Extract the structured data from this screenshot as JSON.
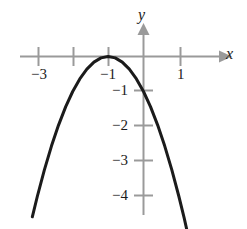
{
  "chart_data": {
    "type": "line",
    "title": "",
    "xlabel": "x",
    "ylabel": "y",
    "equation": "y = -(x + 1)^2",
    "vertex": [
      -1,
      0
    ],
    "opens": "down",
    "xlim": [
      -3.4,
      1.6
    ],
    "ylim": [
      -4.7,
      0.8
    ],
    "grid": false,
    "legend": null,
    "x_ticks": [
      -3,
      -2,
      -1,
      1
    ],
    "x_tick_labels": [
      "-3",
      "",
      "-1",
      "1"
    ],
    "y_ticks": [
      -1,
      -2,
      -3,
      -4
    ],
    "y_tick_labels": [
      "-1",
      "-2",
      "-3",
      "-4"
    ],
    "x": [
      -3.14,
      -3.0,
      -2.8,
      -2.6,
      -2.4,
      -2.2,
      -2.0,
      -1.8,
      -1.6,
      -1.4,
      -1.2,
      -1.0,
      -0.8,
      -0.6,
      -0.4,
      -0.2,
      0.0,
      0.2,
      0.4,
      0.6,
      0.8,
      1.0,
      1.15,
      1.35
    ],
    "y": [
      -4.58,
      -4.0,
      -3.24,
      -2.56,
      -1.96,
      -1.44,
      -1.0,
      -0.64,
      -0.36,
      -0.16,
      -0.04,
      0.0,
      -0.04,
      -0.16,
      -0.36,
      -0.64,
      -1.0,
      -1.44,
      -1.96,
      -2.56,
      -3.24,
      -4.0,
      -4.62,
      -5.52
    ],
    "series": [
      {
        "name": "parabola",
        "color": "#1b1b1b",
        "width": 3
      }
    ],
    "axis_color": "#9a9a9a",
    "axis_arrows": [
      "+x",
      "+y"
    ]
  },
  "labels": {
    "x_axis_name": "x",
    "y_axis_name": "y",
    "x_neg3": "−3",
    "x_neg1": "−1",
    "x_pos1": "1",
    "y_neg1": "−1",
    "y_neg2": "−2",
    "y_neg3": "−3",
    "y_neg4": "−4"
  }
}
